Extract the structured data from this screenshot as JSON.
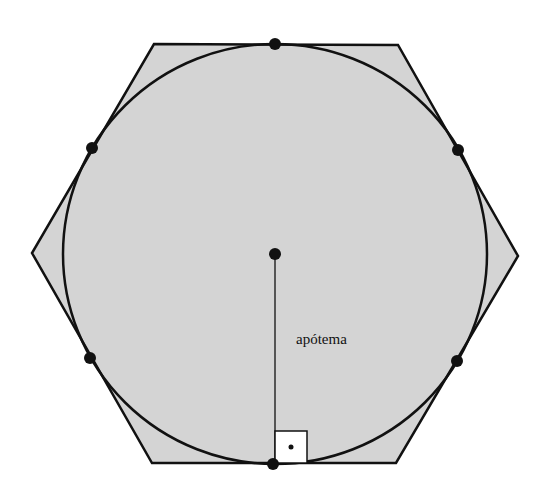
{
  "diagram": {
    "type": "hexagon-inscribed-circle",
    "labels": {
      "apothem": "apótema"
    },
    "colors": {
      "fill": "#d4d4d4",
      "stroke": "#111111",
      "apothem_line": "#555555",
      "right_angle_box": "#ffffff"
    },
    "hexagon": {
      "vertices": [
        [
          154,
          44
        ],
        [
          398,
          45
        ],
        [
          518,
          256
        ],
        [
          396,
          463
        ],
        [
          152,
          463
        ],
        [
          32,
          253
        ]
      ]
    },
    "circle": {
      "cx": 275,
      "cy": 254,
      "rx": 212,
      "ry": 210
    },
    "center_point": [
      275,
      254
    ],
    "tangent_points": [
      [
        275,
        44
      ],
      [
        458,
        150
      ],
      [
        458,
        361
      ],
      [
        275,
        464
      ],
      [
        91,
        358
      ],
      [
        92,
        147
      ]
    ],
    "right_angle_marker": {
      "x": 275,
      "y": 431,
      "size": 32
    }
  }
}
